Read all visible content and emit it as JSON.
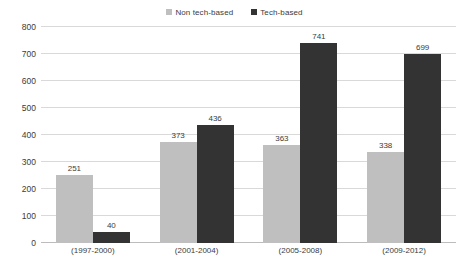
{
  "chart_data": {
    "type": "bar",
    "title": "",
    "xlabel": "",
    "ylabel": "",
    "ylim": [
      0,
      800
    ],
    "ystep": 100,
    "grid": true,
    "legend_position": "top-center",
    "categories": [
      "(1997-2000)",
      "(2001-2004)",
      "(2005-2008)",
      "(2009-2012)"
    ],
    "yticks": [
      "800",
      "700",
      "600",
      "500",
      "400",
      "300",
      "200",
      "100",
      "0"
    ],
    "series": [
      {
        "name": "Non tech-based",
        "color": "#bfbfbf",
        "marker": "square",
        "values": [
          251,
          373,
          363,
          338
        ],
        "labels": [
          "251",
          "373",
          "363",
          "338"
        ]
      },
      {
        "name": "Tech-based",
        "color": "#333333",
        "marker": "square",
        "values": [
          40,
          436,
          741,
          699
        ],
        "labels": [
          "40",
          "436",
          "741",
          "699"
        ]
      }
    ]
  },
  "legend": {
    "items": [
      {
        "label": "Non tech-based",
        "color": "#bfbfbf"
      },
      {
        "label": "Tech-based",
        "color": "#333333"
      }
    ]
  },
  "colors": {
    "non_tech_based": "#bfbfbf",
    "tech_based": "#333333",
    "gridline": "#d9d9d9",
    "axis": "#bcbcbc",
    "text": "#3b3b3b",
    "background": "#ffffff"
  }
}
